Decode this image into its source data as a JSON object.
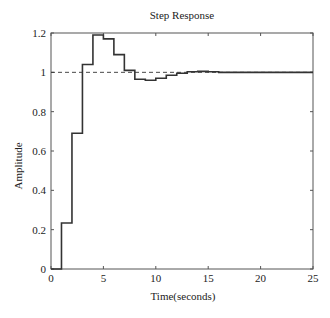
{
  "chart": {
    "title": "Step Response",
    "xlabel": "Time(seconds)",
    "ylabel": "Amplitude",
    "caption": ""
  },
  "chart_data": {
    "type": "line",
    "style": "stairs",
    "title": "Step Response",
    "xlabel": "Time(seconds)",
    "ylabel": "Amplitude",
    "xlim": [
      0,
      25
    ],
    "ylim": [
      0,
      1.2
    ],
    "xticks": [
      0,
      5,
      10,
      15,
      20,
      25
    ],
    "yticks": [
      0,
      0.2,
      0.4,
      0.6,
      0.8,
      1,
      1.2
    ],
    "ytick_labels": [
      "0",
      "0.2",
      "0.4",
      "0.6",
      "0.8",
      "1",
      "1.2"
    ],
    "grid": false,
    "series": [
      {
        "name": "step response",
        "x": [
          0,
          1,
          2,
          3,
          4,
          5,
          6,
          7,
          8,
          9,
          10,
          11,
          12,
          13,
          14,
          15,
          16,
          17,
          18,
          19,
          20,
          21,
          22,
          23,
          24,
          25
        ],
        "values": [
          0,
          0.234,
          0.69,
          1.04,
          1.19,
          1.17,
          1.09,
          1.01,
          0.965,
          0.96,
          0.97,
          0.985,
          0.995,
          1.003,
          1.005,
          1.003,
          1.0,
          1.0,
          1.0,
          1.0,
          1.0,
          1.0,
          1.0,
          1.0,
          1.0,
          1.0
        ]
      }
    ],
    "reference_line": {
      "y": 1.0,
      "style": "dashed"
    }
  }
}
